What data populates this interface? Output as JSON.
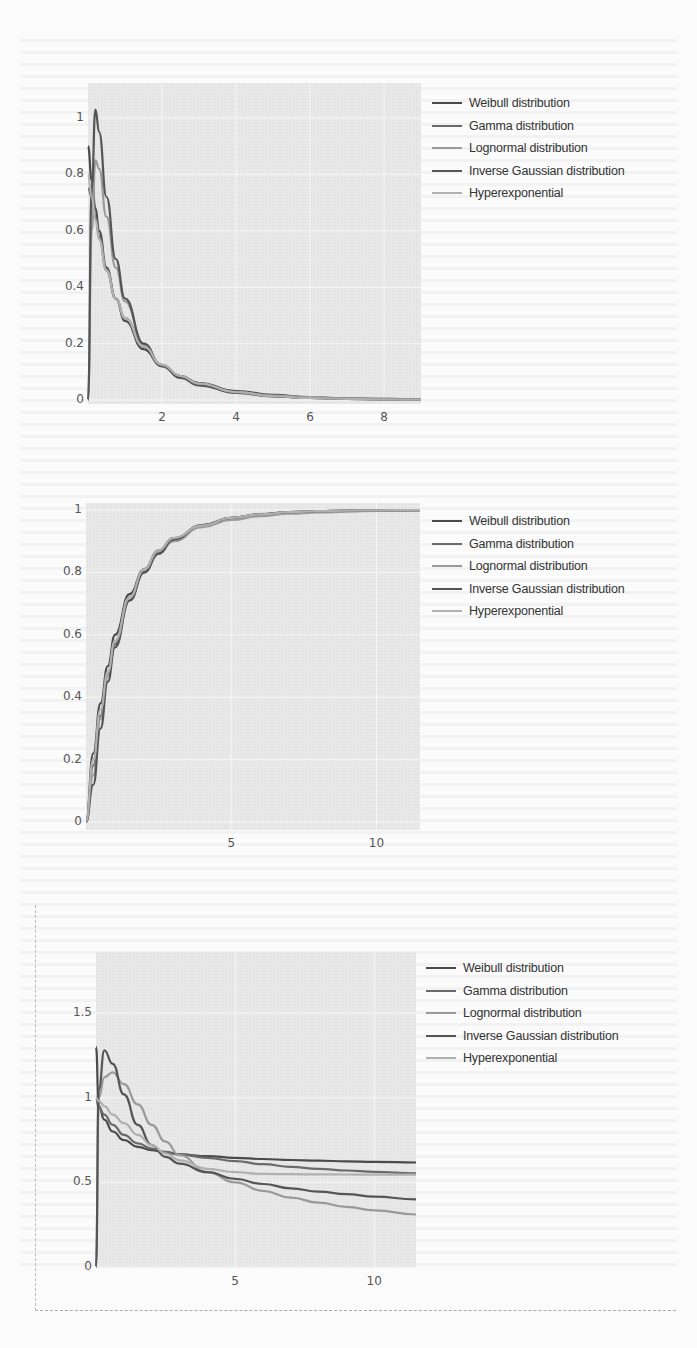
{
  "legend": {
    "items": [
      {
        "label": "Weibull distribution",
        "color": "#4a4a4a"
      },
      {
        "label": "Gamma distribution",
        "color": "#6a6a6a"
      },
      {
        "label": "Lognormal distribution",
        "color": "#9a9a9a"
      },
      {
        "label": "Inverse Gaussian distribution",
        "color": "#555555"
      },
      {
        "label": "Hyperexponential",
        "color": "#b0b0b0"
      }
    ]
  },
  "chart_data": [
    {
      "type": "line",
      "title": "",
      "xlabel": "",
      "ylabel": "",
      "xlim": [
        0,
        9
      ],
      "ylim": [
        -0.02,
        1.08
      ],
      "x_ticks": [
        {
          "v": 2,
          "label": "2"
        },
        {
          "v": 4,
          "label": "4"
        },
        {
          "v": 6,
          "label": "6"
        },
        {
          "v": 8,
          "label": "8"
        }
      ],
      "y_ticks": [
        {
          "v": 0,
          "label": "0"
        },
        {
          "v": 0.2,
          "label": "0.2"
        },
        {
          "v": 0.4,
          "label": "0.4"
        },
        {
          "v": 0.6,
          "label": "0.6"
        },
        {
          "v": 0.8,
          "label": "0.8"
        },
        {
          "v": 1,
          "label": "1"
        }
      ],
      "grid": true,
      "legend_position": "right",
      "x": [
        0,
        0.1,
        0.2,
        0.3,
        0.5,
        0.75,
        1,
        1.5,
        2,
        2.5,
        3,
        4,
        5,
        6,
        7,
        8,
        9
      ],
      "series": [
        {
          "name": "Weibull distribution",
          "values": [
            0.9,
            0.78,
            0.68,
            0.6,
            0.47,
            0.36,
            0.28,
            0.18,
            0.12,
            0.085,
            0.06,
            0.032,
            0.018,
            0.01,
            0.006,
            0.004,
            0.002
          ]
        },
        {
          "name": "Gamma distribution",
          "values": [
            0.75,
            0.72,
            0.65,
            0.58,
            0.46,
            0.36,
            0.29,
            0.19,
            0.125,
            0.085,
            0.058,
            0.028,
            0.014,
            0.007,
            0.004,
            0.002,
            0.001
          ]
        },
        {
          "name": "Lognormal distribution",
          "values": [
            0.0,
            0.6,
            0.85,
            0.82,
            0.65,
            0.47,
            0.35,
            0.2,
            0.12,
            0.08,
            0.055,
            0.028,
            0.016,
            0.01,
            0.006,
            0.004,
            0.003
          ]
        },
        {
          "name": "Inverse Gaussian distribution",
          "values": [
            0.0,
            0.75,
            1.03,
            0.95,
            0.72,
            0.5,
            0.36,
            0.2,
            0.12,
            0.078,
            0.052,
            0.025,
            0.013,
            0.007,
            0.004,
            0.002,
            0.001
          ]
        },
        {
          "name": "Hyperexponential",
          "values": [
            0.8,
            0.72,
            0.64,
            0.57,
            0.46,
            0.36,
            0.29,
            0.19,
            0.125,
            0.085,
            0.058,
            0.028,
            0.014,
            0.007,
            0.004,
            0.002,
            0.001
          ]
        }
      ]
    },
    {
      "type": "line",
      "title": "",
      "xlabel": "",
      "ylabel": "",
      "xlim": [
        0,
        11.5
      ],
      "ylim": [
        -0.02,
        1.03
      ],
      "x_ticks": [
        {
          "v": 5,
          "label": "5"
        },
        {
          "v": 10,
          "label": "10"
        }
      ],
      "y_ticks": [
        {
          "v": 0,
          "label": "0"
        },
        {
          "v": 0.2,
          "label": "0.2"
        },
        {
          "v": 0.4,
          "label": "0.4"
        },
        {
          "v": 0.6,
          "label": "0.6"
        },
        {
          "v": 0.8,
          "label": "0.8"
        },
        {
          "v": 1,
          "label": "1"
        }
      ],
      "grid": true,
      "legend_position": "right",
      "x": [
        0,
        0.25,
        0.5,
        0.75,
        1,
        1.5,
        2,
        2.5,
        3,
        4,
        5,
        6,
        7,
        8,
        9,
        10,
        11.5
      ],
      "series": [
        {
          "name": "Weibull distribution",
          "values": [
            0,
            0.22,
            0.38,
            0.5,
            0.6,
            0.73,
            0.81,
            0.87,
            0.91,
            0.95,
            0.975,
            0.986,
            0.992,
            0.995,
            0.997,
            0.998,
            0.999
          ]
        },
        {
          "name": "Gamma distribution",
          "values": [
            0,
            0.18,
            0.34,
            0.47,
            0.57,
            0.71,
            0.8,
            0.86,
            0.9,
            0.95,
            0.974,
            0.986,
            0.993,
            0.996,
            0.998,
            0.999,
            1.0
          ]
        },
        {
          "name": "Lognormal distribution",
          "values": [
            0,
            0.15,
            0.33,
            0.47,
            0.58,
            0.72,
            0.8,
            0.86,
            0.9,
            0.945,
            0.968,
            0.98,
            0.988,
            0.992,
            0.995,
            0.997,
            0.998
          ]
        },
        {
          "name": "Inverse Gaussian distribution",
          "values": [
            0,
            0.12,
            0.3,
            0.45,
            0.56,
            0.71,
            0.8,
            0.86,
            0.905,
            0.952,
            0.975,
            0.987,
            0.993,
            0.996,
            0.998,
            0.999,
            1.0
          ]
        },
        {
          "name": "Hyperexponential",
          "values": [
            0,
            0.2,
            0.36,
            0.48,
            0.58,
            0.72,
            0.81,
            0.87,
            0.91,
            0.95,
            0.975,
            0.986,
            0.993,
            0.996,
            0.998,
            0.999,
            1.0
          ]
        }
      ]
    },
    {
      "type": "line",
      "title": "",
      "xlabel": "",
      "ylabel": "",
      "xlim": [
        0,
        11.5
      ],
      "ylim": [
        0,
        1.85
      ],
      "x_ticks": [
        {
          "v": 5,
          "label": "5"
        },
        {
          "v": 10,
          "label": "10"
        }
      ],
      "y_ticks": [
        {
          "v": 0,
          "label": "0"
        },
        {
          "v": 0.5,
          "label": "0.5"
        },
        {
          "v": 1,
          "label": "1"
        },
        {
          "v": 1.5,
          "label": "1.5"
        }
      ],
      "grid": true,
      "legend_position": "right",
      "x": [
        0,
        0.1,
        0.3,
        0.6,
        1,
        1.5,
        2,
        2.5,
        3,
        4,
        5,
        6,
        7,
        8,
        9,
        10,
        11.5
      ],
      "series": [
        {
          "name": "Weibull distribution",
          "values": [
            1.3,
            0.95,
            0.87,
            0.8,
            0.75,
            0.71,
            0.69,
            0.675,
            0.665,
            0.655,
            0.645,
            0.638,
            0.632,
            0.628,
            0.624,
            0.621,
            0.617
          ]
        },
        {
          "name": "Gamma distribution",
          "values": [
            1.0,
            0.94,
            0.9,
            0.84,
            0.78,
            0.73,
            0.7,
            0.68,
            0.665,
            0.645,
            0.625,
            0.607,
            0.592,
            0.58,
            0.57,
            0.562,
            0.553
          ]
        },
        {
          "name": "Lognormal distribution",
          "values": [
            0.0,
            1.0,
            1.12,
            1.15,
            1.08,
            0.96,
            0.84,
            0.74,
            0.66,
            0.56,
            0.5,
            0.45,
            0.41,
            0.38,
            0.355,
            0.335,
            0.31
          ]
        },
        {
          "name": "Inverse Gaussian distribution",
          "values": [
            0.0,
            1.05,
            1.28,
            1.2,
            1.02,
            0.84,
            0.72,
            0.65,
            0.61,
            0.56,
            0.52,
            0.49,
            0.465,
            0.445,
            0.43,
            0.415,
            0.4
          ]
        },
        {
          "name": "Hyperexponential",
          "values": [
            1.0,
            0.98,
            0.95,
            0.9,
            0.85,
            0.78,
            0.72,
            0.67,
            0.63,
            0.58,
            0.56,
            0.55,
            0.548,
            0.547,
            0.546,
            0.545,
            0.545
          ]
        }
      ]
    }
  ]
}
